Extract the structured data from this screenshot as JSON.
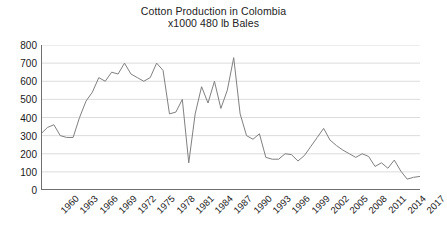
{
  "chart_data": {
    "type": "line",
    "title": "Cotton Production in Colombia",
    "subtitle": "x1000  480 lb Bales",
    "xlabel": "",
    "ylabel": "",
    "ylim": [
      0,
      800
    ],
    "ytick_step": 100,
    "yticks": [
      800,
      700,
      600,
      500,
      400,
      300,
      200,
      100,
      0
    ],
    "grid": true,
    "legend": "none",
    "line_color": "#808080",
    "xtick_labels": [
      "1960",
      "1963",
      "1966",
      "1969",
      "1972",
      "1975",
      "1978",
      "1981",
      "1984",
      "1987",
      "1990",
      "1993",
      "1996",
      "1999",
      "2002",
      "2005",
      "2008",
      "2011",
      "2014",
      "2017"
    ],
    "xtick_step": 3,
    "x": [
      1960,
      1961,
      1962,
      1963,
      1964,
      1965,
      1966,
      1967,
      1968,
      1969,
      1970,
      1971,
      1972,
      1973,
      1974,
      1975,
      1976,
      1977,
      1978,
      1979,
      1980,
      1981,
      1982,
      1983,
      1984,
      1985,
      1986,
      1987,
      1988,
      1989,
      1990,
      1991,
      1992,
      1993,
      1994,
      1995,
      1996,
      1997,
      1998,
      1999,
      2000,
      2001,
      2002,
      2003,
      2004,
      2005,
      2006,
      2007,
      2008,
      2009,
      2010,
      2011,
      2012,
      2013,
      2014,
      2015,
      2016,
      2017,
      2018,
      2019
    ],
    "values": [
      310,
      345,
      360,
      300,
      290,
      290,
      400,
      490,
      540,
      620,
      600,
      650,
      640,
      700,
      640,
      620,
      600,
      620,
      700,
      660,
      420,
      430,
      500,
      150,
      420,
      570,
      480,
      600,
      450,
      550,
      730,
      420,
      300,
      280,
      310,
      180,
      170,
      170,
      200,
      195,
      160,
      190,
      240,
      290,
      340,
      275,
      245,
      220,
      200,
      180,
      200,
      185,
      130,
      150,
      120,
      165,
      105,
      60,
      70,
      75
    ],
    "series": [
      {
        "name": "Cotton production",
        "values": [
          310,
          345,
          360,
          300,
          290,
          290,
          400,
          490,
          540,
          620,
          600,
          650,
          640,
          700,
          640,
          620,
          600,
          620,
          700,
          660,
          420,
          430,
          500,
          150,
          420,
          570,
          480,
          600,
          450,
          550,
          730,
          420,
          300,
          280,
          310,
          180,
          170,
          170,
          200,
          195,
          160,
          190,
          240,
          290,
          340,
          275,
          245,
          220,
          200,
          180,
          200,
          185,
          130,
          150,
          120,
          165,
          105,
          60,
          70,
          75
        ]
      }
    ]
  }
}
